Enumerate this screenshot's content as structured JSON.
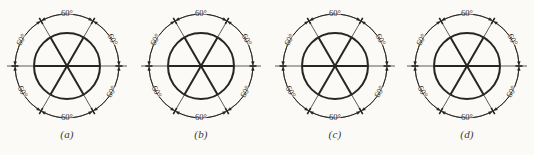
{
  "figure": {
    "name": "hexagon-sector-construction-figure",
    "background_color": "#fbfaf7",
    "ink_color": "#262624",
    "thin_line_color": "#4a4a48",
    "panel_count": 4,
    "angle_label": "60°",
    "labels_per_panel": 6,
    "captions": [
      "(a)",
      "(b)",
      "(c)",
      "(d)"
    ]
  },
  "geometry": {
    "center_x": 67,
    "center_y": 66,
    "inner_radius": 33,
    "outer_radius": 52,
    "centerline_half_length": 60,
    "sector_angle_deg": 60,
    "divider_count": 3,
    "divider_angles_deg": [
      0,
      60,
      120
    ],
    "arc_label_angles_deg": [
      90,
      30,
      330,
      270,
      210,
      150
    ]
  },
  "panels": [
    {
      "id": "a",
      "caption": "(a)",
      "dimension_labels": [
        "60°",
        "60°",
        "60°",
        "60°",
        "60°",
        "60°"
      ],
      "outer_circle_style": "dashed-arc-segments",
      "label_placement": "outside-arc"
    },
    {
      "id": "b",
      "caption": "(b)",
      "dimension_labels": [
        "60°",
        "60°",
        "60°",
        "60°",
        "60°",
        "60°"
      ],
      "outer_circle_style": "continuous-with-ticks",
      "label_placement": "inside-arc"
    },
    {
      "id": "c",
      "caption": "(c)",
      "dimension_labels": [
        "60°",
        "60°",
        "60°",
        "60°",
        "60°",
        "60°"
      ],
      "outer_circle_style": "continuous-with-ticks",
      "label_placement": "inside-arc-bottom-outside"
    },
    {
      "id": "d",
      "caption": "(d)",
      "dimension_labels": [
        "60°",
        "60°",
        "60°",
        "60°",
        "60°",
        "60°"
      ],
      "outer_circle_style": "continuous-with-ticks",
      "label_placement": "inside-arc"
    }
  ]
}
